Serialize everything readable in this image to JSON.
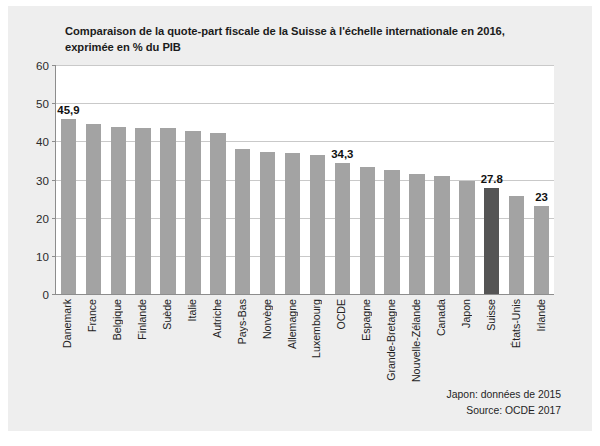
{
  "chart_data": {
    "type": "bar",
    "title": "Comparaison de la quote-part fiscale de la Suisse à l'échelle internationale en 2016, exprimée en % du PIB",
    "title_lines": [
      "Comparaison de la quote-part fiscale de la Suisse à l'échelle internationale en 2016,",
      "exprimée en % du PIB"
    ],
    "xlabel": "",
    "ylabel": "",
    "ylim": [
      0,
      60
    ],
    "yticks": [
      0,
      10,
      20,
      30,
      40,
      50,
      60
    ],
    "grid": true,
    "legend": false,
    "categories": [
      "Danemark",
      "France",
      "Belgique",
      "Finlande",
      "Suède",
      "Italie",
      "Autriche",
      "Pays-Bas",
      "Norvège",
      "Allemagne",
      "Luxembourg",
      "OCDE",
      "Espagne",
      "Grande-Bretagne",
      "Nouvelle-Zélande",
      "Canada",
      "Japon",
      "Suisse",
      "États-Unis",
      "Irlande"
    ],
    "values": [
      45.9,
      44.6,
      43.7,
      43.6,
      43.4,
      42.6,
      42.2,
      38.1,
      37.2,
      36.9,
      36.4,
      34.3,
      33.3,
      32.6,
      31.5,
      30.8,
      29.7,
      27.8,
      25.6,
      23.0
    ],
    "data_labels": [
      {
        "category": "Danemark",
        "text": "45,9"
      },
      {
        "category": "OCDE",
        "text": "34,3"
      },
      {
        "category": "Suisse",
        "text": "27.8"
      },
      {
        "category": "Irlande",
        "text": "23"
      }
    ],
    "highlight_category": "Suisse",
    "bar_color": "#a3a3a3",
    "highlight_color": "#545454",
    "plot_background": "#ffffff",
    "figure_background": "#eeeeee",
    "gridline_color": "#c9c9c9",
    "axis_color": "#8d8d8d",
    "annotations": [
      "Japon: données de 2015",
      "Source: OCDE 2017"
    ]
  }
}
